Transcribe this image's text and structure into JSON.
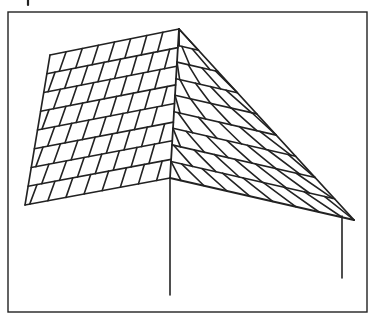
{
  "figure": {
    "stroke_color": "#222222",
    "background": "#ffffff",
    "frame": {
      "x": 8,
      "y": 12,
      "width": 359,
      "height": 300
    },
    "top_mark": {
      "x": 28,
      "y1": 0,
      "y2": 5
    },
    "peak": [
      179,
      29
    ],
    "left_face": {
      "top_left": [
        50,
        55
      ],
      "bottom_left": [
        25,
        205
      ],
      "bottom_right": [
        170,
        178
      ],
      "courses": 8,
      "shingles_per_course": 8
    },
    "right_face": {
      "outer_bottom": [
        354,
        220
      ],
      "courses": 9,
      "shingles_per_course": 7
    },
    "corner_post": {
      "x": 170,
      "y1": 178,
      "y2": 295
    },
    "right_post": {
      "x": 342,
      "y1": 216,
      "y2": 278
    }
  }
}
